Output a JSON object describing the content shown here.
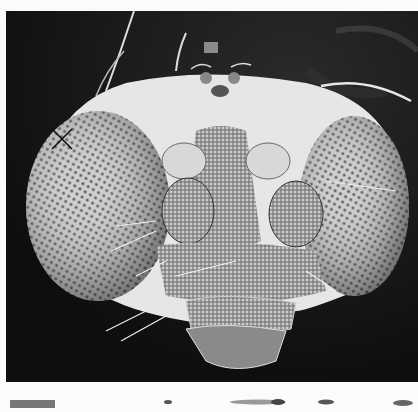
{
  "figure": {
    "marker": {
      "glyph": "X",
      "x": 60,
      "y": 138
    },
    "colors": {
      "background": "#141414",
      "page": "#fbfbfb",
      "cuticle": "#e8e8e8",
      "eye": "#bdbdbd"
    }
  },
  "next_figure_strip": {
    "visible": true
  }
}
